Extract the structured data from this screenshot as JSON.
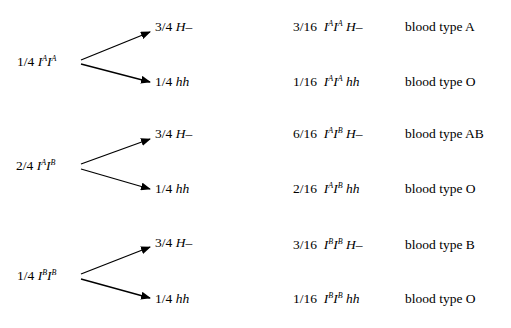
{
  "groups": [
    {
      "parent": {
        "frac": "1/4",
        "allele1": "A",
        "allele2": "A"
      },
      "branches": [
        {
          "frac": "3/4",
          "geno": "H–"
        },
        {
          "frac": "1/4",
          "geno": "hh"
        }
      ],
      "results": [
        {
          "frac": "3/16",
          "allele1": "A",
          "allele2": "A",
          "geno": "H–",
          "phenotype": "blood type A"
        },
        {
          "frac": "1/16",
          "allele1": "A",
          "allele2": "A",
          "geno": "hh",
          "phenotype": "blood type O"
        }
      ]
    },
    {
      "parent": {
        "frac": "2/4",
        "allele1": "A",
        "allele2": "B"
      },
      "branches": [
        {
          "frac": "3/4",
          "geno": "H–"
        },
        {
          "frac": "1/4",
          "geno": "hh"
        }
      ],
      "results": [
        {
          "frac": "6/16",
          "allele1": "A",
          "allele2": "B",
          "geno": "H–",
          "phenotype": "blood type AB"
        },
        {
          "frac": "2/16",
          "allele1": "A",
          "allele2": "B",
          "geno": "hh",
          "phenotype": "blood type O"
        }
      ]
    },
    {
      "parent": {
        "frac": "1/4",
        "allele1": "B",
        "allele2": "B"
      },
      "branches": [
        {
          "frac": "3/4",
          "geno": "H–"
        },
        {
          "frac": "1/4",
          "geno": "hh"
        }
      ],
      "results": [
        {
          "frac": "3/16",
          "allele1": "B",
          "allele2": "B",
          "geno": "H–",
          "phenotype": "blood type B"
        },
        {
          "frac": "1/16",
          "allele1": "B",
          "allele2": "B",
          "geno": "hh",
          "phenotype": "blood type O"
        }
      ]
    }
  ],
  "gene_symbol": "I"
}
